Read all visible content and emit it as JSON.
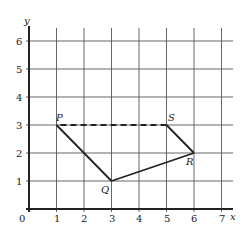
{
  "diagram": {
    "type": "coordinate-grid-polygon",
    "axes": {
      "x_label": "x",
      "y_label": "y",
      "origin_label": "0",
      "x_ticks": [
        "1",
        "2",
        "3",
        "4",
        "5",
        "6",
        "7"
      ],
      "y_ticks": [
        "1",
        "2",
        "3",
        "4",
        "5",
        "6"
      ]
    },
    "points": [
      {
        "name": "P",
        "x": 1,
        "y": 3
      },
      {
        "name": "Q",
        "x": 3,
        "y": 1
      },
      {
        "name": "R",
        "x": 6,
        "y": 2
      },
      {
        "name": "S",
        "x": 5,
        "y": 3
      }
    ],
    "segments": [
      {
        "from": "P",
        "to": "Q",
        "style": "solid"
      },
      {
        "from": "Q",
        "to": "R",
        "style": "solid"
      },
      {
        "from": "R",
        "to": "S",
        "style": "solid"
      },
      {
        "from": "S",
        "to": "P",
        "style": "dashed"
      }
    ],
    "colors": {
      "line": "#222222",
      "grid": "#555555",
      "background": "#ffffff"
    }
  }
}
